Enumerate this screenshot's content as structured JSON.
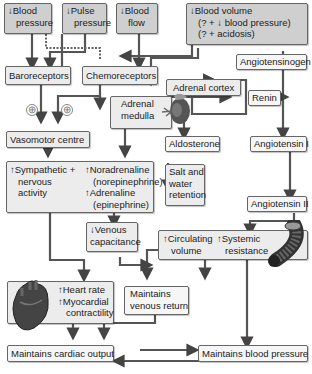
{
  "diagram": {
    "nodes": {
      "blood_pressure": {
        "arrow": "↓",
        "line1": "Blood",
        "line2": "pressure"
      },
      "pulse_pressure": {
        "arrow": "↓",
        "line1": "Pulse",
        "line2": "pressure"
      },
      "blood_flow": {
        "arrow": "↓",
        "line1": "Blood",
        "line2": "flow"
      },
      "blood_volume": {
        "arrow": "↓",
        "line1": "Blood volume",
        "line2": "(? + ↓ blood pressure)",
        "line3": "(? + acidosis)"
      },
      "baroreceptors": "Baroreceptors",
      "chemoreceptors": "Chemoreceptors",
      "angiotensinogen": "Angiotensinogen",
      "adrenal_cortex": "Adrenal cortex",
      "adrenal_medulla": {
        "line1": "Adrenal",
        "line2": "medulla"
      },
      "renin": "Renin",
      "vasomotor_centre": "Vasomotor centre",
      "aldosterone": "Aldosterone",
      "angiotensin_1": "Angiotensin I",
      "sympathetic": {
        "arrow": "↑",
        "line1": "Sympathetic +",
        "line2": "nervous",
        "line3": "activity"
      },
      "noradrenaline": {
        "arrow": "↑",
        "line1": "Noradrenaline",
        "line2": "(norepinephrine)"
      },
      "adrenaline": {
        "arrow": "↑",
        "line1": "Adrenaline",
        "line2": "(epinephrine)"
      },
      "salt_water": {
        "line1": "Salt and",
        "line2": "water",
        "line3": "retention"
      },
      "angiotensin_2": "Angiotensin II",
      "venous_capacitance": {
        "arrow": "↓",
        "line1": "Venous",
        "line2": "capacitance"
      },
      "circulating_volume": {
        "arrow": "↑",
        "line1": "Circulating",
        "line2": "volume"
      },
      "systemic_resistance": {
        "arrow": "↑",
        "line1": "Systemic",
        "line2": "resistance"
      },
      "heart_rate": {
        "arrow": "↑",
        "line1": "Heart rate"
      },
      "myocardial": {
        "arrow": "↑",
        "line1": "Myocardial",
        "line2": "contractility"
      },
      "venous_return": {
        "line1": "Maintains",
        "line2": "venous return"
      },
      "cardiac_output": "Maintains cardiac output",
      "maintains_bp": "Maintains blood pressure"
    },
    "signs": {
      "plus": "⊕"
    }
  }
}
